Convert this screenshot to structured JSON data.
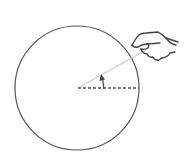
{
  "diagram": {
    "colors": {
      "background": "#ffffff",
      "circle_stroke": "#555555",
      "dashed_radius": "#555555",
      "rotating_radius": "#cccccc",
      "arrow": "#444444",
      "hand_stroke": "#444444"
    },
    "circle": {
      "cx": 77,
      "cy": 88,
      "r": 62
    },
    "reference_radius": {
      "x1": 78,
      "y1": 88,
      "x2": 139,
      "y2": 88,
      "style": "dashed"
    },
    "rotating_radius": {
      "x1": 78,
      "y1": 88,
      "x2": 146,
      "y2": 50,
      "style": "solid-light"
    },
    "arrow": {
      "x": 103,
      "from_y": 88,
      "to_y": 75,
      "direction": "up"
    },
    "hand": {
      "icon": "hand-grabbing-icon",
      "x": 128,
      "y": 30
    }
  }
}
